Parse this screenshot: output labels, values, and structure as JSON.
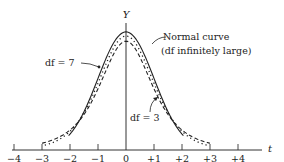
{
  "chart_data": {
    "type": "line",
    "title": "",
    "xlabel": "t",
    "ylabel": "Y",
    "xlim": [
      -4.5,
      4.5
    ],
    "x_ticks": [
      -4,
      -3,
      -2,
      -1,
      0,
      1,
      2,
      3,
      4
    ],
    "x_tick_labels": [
      "−4",
      "−3",
      "−2",
      "−1",
      "0",
      "+1",
      "+2",
      "+3",
      "+4"
    ],
    "grid": false,
    "legend": "annotations",
    "series": [
      {
        "name": "Normal curve (df infinitely large)",
        "style": "solid",
        "df": null,
        "peak_density": 0.399
      },
      {
        "name": "df = 7",
        "style": "dotted",
        "df": 7,
        "peak_density": 0.38
      },
      {
        "name": "df = 3",
        "style": "dashed",
        "df": 3,
        "peak_density": 0.368
      }
    ],
    "annotations": [
      {
        "text": "Normal curve",
        "line2": "(df infinitely large)",
        "points_to": "solid curve near t=0.6"
      },
      {
        "text": "df = 7",
        "points_to": "dotted curve near t=-1.2"
      },
      {
        "text": "df = 3",
        "points_to": "dashed curve near t=1.0"
      }
    ]
  },
  "labels": {
    "y_axis": "Y",
    "x_axis": "t",
    "normal_line1": "Normal curve",
    "normal_line2": "(df infinitely large)",
    "df7": "df = 7",
    "df3": "df = 3",
    "ticks": [
      "−4",
      "−3",
      "−2",
      "−1",
      "0",
      "+1",
      "+2",
      "+3",
      "+4"
    ]
  }
}
